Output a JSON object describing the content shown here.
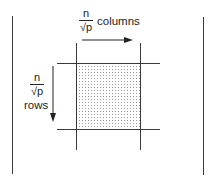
{
  "diagram": {
    "column_label": {
      "numerator": "n",
      "denominator": "√p",
      "text": "columns"
    },
    "row_label": {
      "numerator": "n",
      "denominator": "√p",
      "text": "rows"
    },
    "colors": {
      "line": "#3a3a3a",
      "dots": "#9a9a9a",
      "background": "#ffffff"
    }
  }
}
